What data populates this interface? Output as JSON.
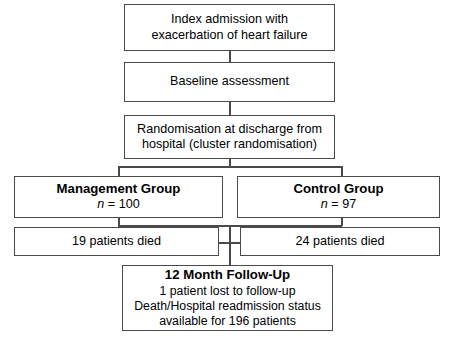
{
  "diagram": {
    "type": "clinical-trial-flowchart",
    "background_color": "#ffffff",
    "border_color": "#4a4a4a",
    "text_color": "#000000",
    "nodes": {
      "index_admission": {
        "line1": "Index admission with",
        "line2": "exacerbation of heart failure"
      },
      "baseline": {
        "line1": "Baseline assessment"
      },
      "randomisation": {
        "line1": "Randomisation at discharge from",
        "line2": "hospital (cluster randomisation)"
      },
      "management_group": {
        "title": "Management Group",
        "n_symbol": "n",
        "n_value": "= 100"
      },
      "control_group": {
        "title": "Control Group",
        "n_symbol": "n",
        "n_value": "= 97"
      },
      "management_deaths": {
        "line1": "19 patients died"
      },
      "control_deaths": {
        "line1": "24 patients died"
      },
      "follow_up": {
        "title": "12 Month Follow-Up",
        "line1": "1 patient lost to follow-up",
        "line2": "Death/Hospital readmission status",
        "line3": "available for 196 patients"
      }
    }
  }
}
